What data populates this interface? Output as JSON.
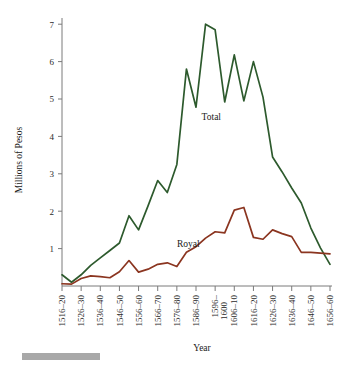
{
  "chart_data": {
    "type": "line",
    "title": "",
    "xlabel": "Year",
    "ylabel": "Millions of Pesos",
    "xlim": [
      0,
      15
    ],
    "ylim": [
      0,
      7.4
    ],
    "grid": false,
    "legend": "inline-labels",
    "y_ticks": [
      1,
      2,
      3,
      4,
      5,
      6,
      7
    ],
    "categories": [
      "1516–20",
      "1521–25",
      "1526–30",
      "1531–35",
      "1536–40",
      "1541–45",
      "1546–50",
      "1551–55",
      "1556–60",
      "1561–65",
      "1566–70",
      "1571–75",
      "1576–80",
      "1581–85",
      "1586–90",
      "1591–95",
      "1596–1600",
      "1601–05",
      "1606–10",
      "1611–15",
      "1616–20",
      "1621–25",
      "1626–30",
      "1631–35",
      "1636–40",
      "1641–45",
      "1646–50",
      "1651–55",
      "1656–60"
    ],
    "tick_labels": [
      "1516–20",
      "1526–30",
      "1536–40",
      "1546–50",
      "1556–60",
      "1566–70",
      "1576–80",
      "1586–90",
      "1596–",
      "1606–10",
      "1616–20",
      "1626–30",
      "1636–40",
      "1646–50",
      "1656–60"
    ],
    "tick_label_second_line": "1600",
    "tick_label_second_line_index": 8,
    "series": [
      {
        "name": "Total",
        "color": "#2d5a2d",
        "label_x_index": 15.6,
        "label_y_value": 4.45,
        "values": [
          0.3,
          0.1,
          0.3,
          0.55,
          0.75,
          0.95,
          1.15,
          1.88,
          1.5,
          2.15,
          2.82,
          2.5,
          3.25,
          5.8,
          4.78,
          7.0,
          6.85,
          4.92,
          6.18,
          4.95,
          6.0,
          5.05,
          3.45,
          3.05,
          2.62,
          2.22,
          1.55,
          1.02,
          0.58
        ]
      },
      {
        "name": "Royal",
        "color": "#8b3520",
        "label_x_index": 13.2,
        "label_y_value": 1.03,
        "values": [
          0.06,
          0.05,
          0.2,
          0.27,
          0.25,
          0.22,
          0.38,
          0.68,
          0.37,
          0.45,
          0.58,
          0.62,
          0.52,
          0.9,
          1.05,
          1.28,
          1.45,
          1.42,
          2.03,
          2.1,
          1.3,
          1.25,
          1.5,
          1.4,
          1.32,
          0.9,
          0.9,
          0.88,
          0.86
        ]
      }
    ]
  },
  "footer": {
    "scale_bar_present": true
  }
}
